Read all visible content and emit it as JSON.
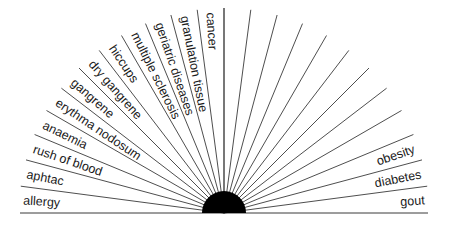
{
  "diagram": {
    "type": "radial-fan",
    "center": {
      "x": 224,
      "y": 213
    },
    "ray_radius": 205,
    "hub_radius": 22,
    "ray_count": 25,
    "ray_step_degrees": 7.5,
    "colors": {
      "ray": "#3a3a3a",
      "hub": "#000000",
      "text": "#1a1a1a",
      "background": "#ffffff"
    },
    "left_labels": [
      "allergy",
      "aphtac",
      "rush of blood",
      "anaemia",
      "erythma nodosum",
      "gangrene",
      "dry gangrene",
      "hiccups",
      "multiple sclerosis",
      "geriatric diseases",
      "granulation tissue",
      "cancer"
    ],
    "right_labels": [
      "gout",
      "diabetes",
      "obesity"
    ]
  }
}
